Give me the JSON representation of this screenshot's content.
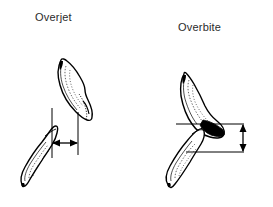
{
  "figure": {
    "type": "dental-anatomy-diagram",
    "background_color": "#ffffff",
    "ink_color": "#000000",
    "label_color": "#2b2b2b",
    "width": 273,
    "height": 207
  },
  "panels": [
    {
      "id": "overjet",
      "label": "Overjet",
      "measurement_orientation": "horizontal",
      "description_text": "",
      "teeth": [
        {
          "name": "upper-incisor",
          "position": "upper-right",
          "tilt_deg": 28
        },
        {
          "name": "lower-incisor",
          "position": "lower-left",
          "tilt_deg": 38
        }
      ],
      "guides": [
        {
          "name": "left-reference-line",
          "orientation": "vertical"
        },
        {
          "name": "right-reference-line",
          "orientation": "vertical"
        }
      ],
      "arrow": {
        "name": "overjet-arrow",
        "orientation": "horizontal",
        "heads": "double"
      }
    },
    {
      "id": "overbite",
      "label": "Overbite",
      "measurement_orientation": "vertical",
      "description_text": "",
      "teeth": [
        {
          "name": "upper-incisor",
          "position": "upper-left",
          "tilt_deg": 20
        },
        {
          "name": "lower-incisor",
          "position": "lower-left",
          "tilt_deg": 40
        }
      ],
      "guides": [
        {
          "name": "top-reference-line",
          "orientation": "horizontal"
        },
        {
          "name": "bottom-reference-line",
          "orientation": "horizontal"
        }
      ],
      "arrow": {
        "name": "overbite-arrow",
        "orientation": "vertical",
        "heads": "double"
      }
    }
  ]
}
